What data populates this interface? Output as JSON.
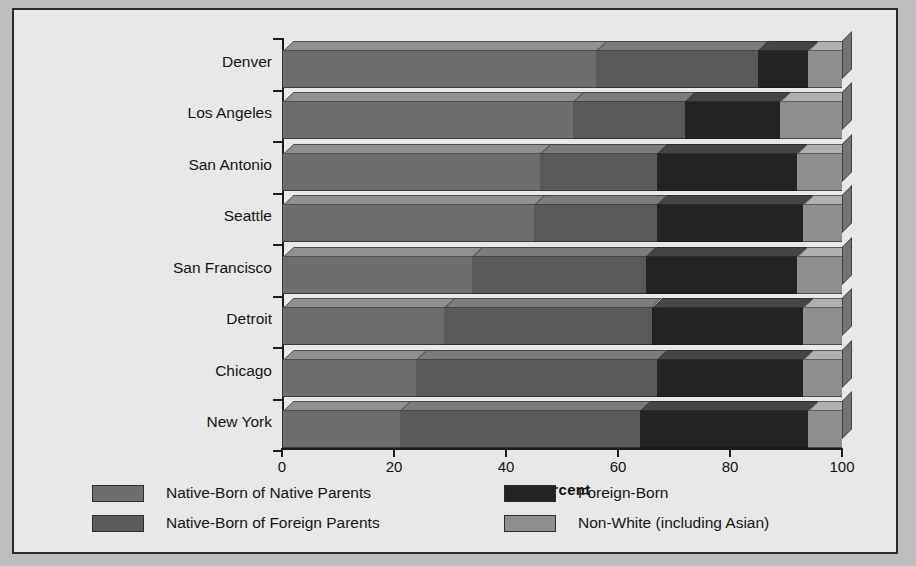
{
  "chart_data": {
    "type": "bar",
    "orientation": "horizontal",
    "stacked": true,
    "title": "",
    "xlabel": "Percent",
    "ylabel": "",
    "xlim": [
      0,
      100
    ],
    "xticks": [
      0,
      20,
      40,
      60,
      80,
      100
    ],
    "xticklabels": [
      "0",
      "20",
      "40",
      "60",
      "80",
      "100"
    ],
    "grid": false,
    "legend_position": "bottom",
    "categories": [
      "Denver",
      "Los Angeles",
      "San Antonio",
      "Seattle",
      "San Francisco",
      "Detroit",
      "Chicago",
      "New York"
    ],
    "series": [
      {
        "name": "Native-Born of Native Parents",
        "color": "#6e6e6e",
        "values": [
          56,
          52,
          46,
          45,
          34,
          29,
          24,
          21
        ]
      },
      {
        "name": "Native-Born of Foreign Parents",
        "color": "#5a5a5a",
        "values": [
          29,
          20,
          21,
          22,
          31,
          37,
          43,
          43
        ]
      },
      {
        "name": "Foreign-Born",
        "color": "#232323",
        "values": [
          9,
          17,
          25,
          26,
          27,
          27,
          26,
          30
        ]
      },
      {
        "name": "Non-White (including Asian)",
        "color": "#8e8e8e",
        "values": [
          6,
          11,
          8,
          7,
          8,
          7,
          7,
          6
        ]
      }
    ]
  },
  "axis": {
    "x_title": "Percent",
    "tick_labels": [
      "0",
      "20",
      "40",
      "60",
      "80",
      "100"
    ]
  },
  "categories": [
    "Denver",
    "Los Angeles",
    "San Antonio",
    "Seattle",
    "San Francisco",
    "Detroit",
    "Chicago",
    "New York"
  ],
  "legend": {
    "items": [
      {
        "label": "Native-Born of Native Parents",
        "color": "#6e6e6e"
      },
      {
        "label": "Native-Born of Foreign Parents",
        "color": "#5a5a5a"
      },
      {
        "label": "Foreign-Born",
        "color": "#232323"
      },
      {
        "label": "Non-White (including Asian)",
        "color": "#8e8e8e"
      }
    ]
  },
  "colors": {
    "figure_background": "#e8e8e8",
    "page_background": "#bdbdbd",
    "frame_border": "#2a2a2a",
    "axis": "#1c1c1c",
    "text": "#141414"
  }
}
